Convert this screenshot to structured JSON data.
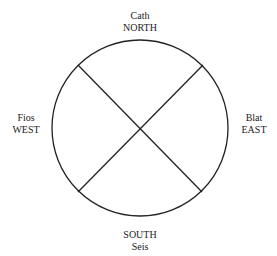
{
  "diagram": {
    "type": "compass-quadrant",
    "stroke_color": "#222222",
    "circle": {
      "cx": 140,
      "cy": 128,
      "r": 88
    },
    "labels": {
      "north": {
        "line1": "Cath",
        "line2": "NORTH"
      },
      "west": {
        "line1": "Fios",
        "line2": "WEST"
      },
      "east": {
        "line1": "Blat",
        "line2": "EAST"
      },
      "south": {
        "line1": "SOUTH",
        "line2": "Seis"
      }
    }
  }
}
